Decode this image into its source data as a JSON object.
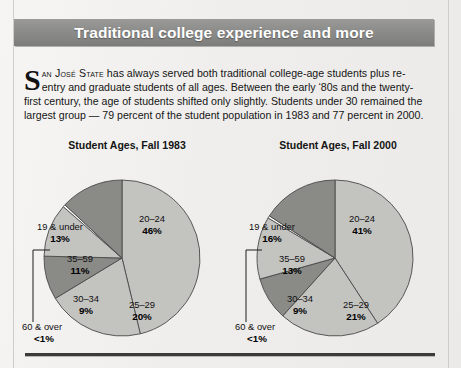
{
  "header": {
    "title": "Traditional college experience and more"
  },
  "intro": {
    "dropcap": "S",
    "lead_smallcaps": "an José State",
    "body": " has always served both traditional college-age students plus re-entry and graduate students of all ages. Between the early ‘80s and the twenty-first century, the age of students shifted only slightly. Students under 30 remained the largest group — 79 percent of the student population in 1983 and 77 percent in 2000."
  },
  "colors": {
    "light_slice": "#c3c3c0",
    "dark_slice": "#8a8a87",
    "tiny_slice": "#ffffff",
    "outline": "#4a4a48",
    "banner_start": "#9a9a99",
    "banner_end": "#7c7c7b",
    "rule": "#3b3b3b"
  },
  "chart_data": [
    {
      "type": "pie",
      "title": "Student Ages, Fall 1983",
      "center": [
        122,
        258
      ],
      "radius": 78,
      "start_angle_deg": -90,
      "categories": [
        "20–24",
        "25–29",
        "30–34",
        "35–59",
        "60 & over",
        "19 & under"
      ],
      "values": [
        46,
        20,
        9,
        11,
        0.5,
        13
      ],
      "value_labels": [
        "46%",
        "20%",
        "9%",
        "11%",
        "<1%",
        "13%"
      ],
      "slice_tones": [
        "light",
        "light",
        "dark",
        "light",
        "tiny",
        "dark"
      ],
      "label_positions": [
        [
          152,
          222
        ],
        [
          142,
          308
        ],
        [
          86,
          302
        ],
        [
          80,
          262
        ],
        null,
        [
          60,
          230
        ]
      ],
      "callout": {
        "index": 4,
        "label": "60 & over",
        "value_label": "<1%",
        "text_xy": [
          22,
          330
        ],
        "line": [
          [
            33,
            250
          ],
          [
            50,
            250
          ],
          [
            33,
            250
          ],
          [
            33,
            322
          ]
        ]
      }
    },
    {
      "type": "pie",
      "title": "Student Ages, Fall 2000",
      "center": [
        335,
        258
      ],
      "radius": 78,
      "start_angle_deg": -90,
      "categories": [
        "20–24",
        "25–29",
        "30–34",
        "35–59",
        "60 & over",
        "19 & under"
      ],
      "values": [
        41,
        21,
        9,
        13,
        0.5,
        16
      ],
      "value_labels": [
        "41%",
        "21%",
        "9%",
        "13%",
        "<1%",
        "16%"
      ],
      "slice_tones": [
        "light",
        "light",
        "dark",
        "light",
        "tiny",
        "dark"
      ],
      "label_positions": [
        [
          362,
          222
        ],
        [
          356,
          308
        ],
        [
          300,
          302
        ],
        [
          292,
          262
        ],
        null,
        [
          272,
          230
        ]
      ],
      "callout": {
        "index": 4,
        "label": "60 & over",
        "value_label": "<1%",
        "text_xy": [
          235,
          330
        ],
        "line": [
          [
            246,
            250
          ],
          [
            262,
            250
          ],
          [
            246,
            250
          ],
          [
            246,
            322
          ]
        ]
      }
    }
  ]
}
